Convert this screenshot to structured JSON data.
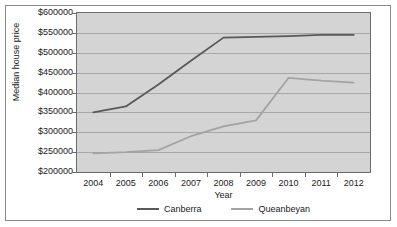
{
  "chart_data": {
    "type": "line",
    "title": "",
    "xlabel": "Year",
    "ylabel": "Median house price",
    "categories": [
      "2004",
      "2005",
      "2006",
      "2007",
      "2008",
      "2009",
      "2010",
      "2011",
      "2012"
    ],
    "ylim": [
      200000,
      600000
    ],
    "ytick_labels": [
      "$600000",
      "$550000",
      "$500000",
      "$450000",
      "$400000",
      "$350000",
      "$300000",
      "$250000",
      "$200000"
    ],
    "ytick_values": [
      600000,
      550000,
      500000,
      450000,
      400000,
      350000,
      300000,
      250000,
      200000
    ],
    "grid": true,
    "legend_position": "bottom",
    "plot_background": "#d4d4d4",
    "series": [
      {
        "name": "Canberra",
        "color": "#595959",
        "values": [
          350000,
          365000,
          420000,
          480000,
          538000,
          540000,
          542000,
          545000,
          545000
        ]
      },
      {
        "name": "Queanbeyan",
        "color": "#a3a3a3",
        "values": [
          247000,
          250000,
          255000,
          290000,
          315000,
          330000,
          437000,
          430000,
          425000
        ]
      }
    ]
  }
}
